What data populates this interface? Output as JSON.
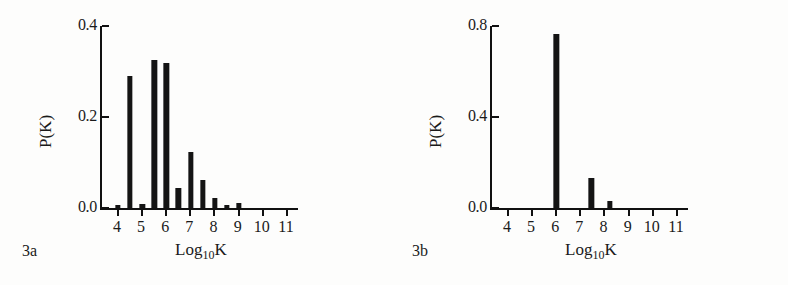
{
  "figure": {
    "background": "#fdfdfc",
    "ink_color": "#141414"
  },
  "panels": [
    {
      "tag": "3a",
      "ylabel": "P(K)",
      "xlabel_main": "Log",
      "xlabel_sub": "10",
      "xlabel_tail": "K"
    },
    {
      "tag": "3b",
      "ylabel": "P(K)",
      "xlabel_main": "Log",
      "xlabel_sub": "10",
      "xlabel_tail": "K"
    }
  ],
  "chart_data": [
    {
      "type": "bar",
      "title": "3a",
      "xlabel": "Log10K",
      "ylabel": "P(K)",
      "xlim": [
        3.3,
        11.5
      ],
      "ylim": [
        0.0,
        0.4
      ],
      "ytick_labels": [
        "0.0",
        "0.2",
        "0.4"
      ],
      "ytick_values": [
        0.0,
        0.2,
        0.4
      ],
      "xtick_labels": [
        "4",
        "5",
        "6",
        "7",
        "8",
        "9",
        "10",
        "11"
      ],
      "xtick_values": [
        4,
        5,
        6,
        7,
        8,
        9,
        10,
        11
      ],
      "grid": false,
      "legend": "none",
      "bar_width": 0.22,
      "x": [
        4.05,
        4.55,
        5.05,
        5.55,
        6.05,
        6.55,
        7.05,
        7.55,
        8.05,
        8.55,
        9.05
      ],
      "values": [
        0.006,
        0.29,
        0.008,
        0.325,
        0.318,
        0.043,
        0.124,
        0.062,
        0.021,
        0.007,
        0.012
      ]
    },
    {
      "type": "bar",
      "title": "3b",
      "xlabel": "Log10K",
      "ylabel": "P(K)",
      "xlim": [
        3.3,
        11.5
      ],
      "ylim": [
        0.0,
        0.8
      ],
      "ytick_labels": [
        "0.0",
        "0.4",
        "0.8"
      ],
      "ytick_values": [
        0.0,
        0.4,
        0.8
      ],
      "xtick_labels": [
        "4",
        "5",
        "6",
        "7",
        "8",
        "9",
        "10",
        "11"
      ],
      "xtick_values": [
        4,
        5,
        6,
        7,
        8,
        9,
        10,
        11
      ],
      "grid": false,
      "legend": "none",
      "bar_width": 0.22,
      "x": [
        6.05,
        7.5,
        8.25
      ],
      "values": [
        0.767,
        0.13,
        0.03
      ]
    }
  ]
}
